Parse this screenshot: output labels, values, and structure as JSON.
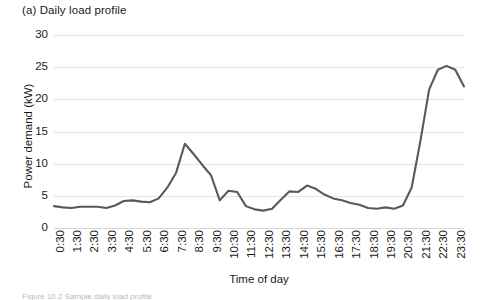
{
  "figure": {
    "panel_title": "(a) Daily load profile",
    "caption_partial": "Figure 10.2  Sample daily load profile",
    "line_color": "#595959",
    "grid_color": "#e3e3e3",
    "background_color": "#ffffff"
  },
  "chart_data": {
    "type": "line",
    "title": "(a) Daily load profile",
    "xlabel": "Time of day",
    "ylabel": "Power demand (kW)",
    "ylim": [
      0,
      30
    ],
    "yticks": [
      0,
      5,
      10,
      15,
      20,
      25,
      30
    ],
    "grid": true,
    "legend": null,
    "x": [
      "0:30",
      "1:00",
      "1:30",
      "2:00",
      "2:30",
      "3:00",
      "3:30",
      "4:00",
      "4:30",
      "5:00",
      "5:30",
      "6:00",
      "6:30",
      "7:00",
      "7:30",
      "8:00",
      "8:30",
      "9:00",
      "9:30",
      "10:00",
      "10:30",
      "11:00",
      "11:30",
      "12:00",
      "12:30",
      "13:00",
      "13:30",
      "14:00",
      "14:30",
      "15:00",
      "15:30",
      "16:00",
      "16:30",
      "17:00",
      "17:30",
      "18:00",
      "18:30",
      "19:00",
      "19:30",
      "20:00",
      "20:30",
      "21:00",
      "21:30",
      "22:00",
      "22:30",
      "23:00",
      "23:30",
      "24:00"
    ],
    "xticks": [
      "0:30",
      "1:30",
      "2:30",
      "3:30",
      "4:30",
      "5:30",
      "6:30",
      "7:30",
      "8:30",
      "9:30",
      "10:30",
      "11:30",
      "12:30",
      "13:30",
      "14:30",
      "15:30",
      "16:30",
      "17:30",
      "18:30",
      "19:30",
      "20:30",
      "21:30",
      "22:30",
      "23:30"
    ],
    "xtick_rotation": 90,
    "values": [
      3.4,
      3.2,
      3.1,
      3.3,
      3.3,
      3.3,
      3.1,
      3.5,
      4.2,
      4.3,
      4.1,
      8.0,
      10.5,
      13.1,
      11.6,
      9.6,
      7.6,
      4.3,
      5.8,
      4.3,
      3.6,
      3.4,
      2.7,
      2.8,
      3.8,
      5.6,
      5.9,
      5.6,
      6.6,
      6.0,
      5.1,
      4.6,
      4.2,
      3.6,
      3.2,
      3.0,
      3.1,
      3.4,
      3.0,
      3.1,
      4.6,
      8.0,
      14.5,
      20.5,
      24.0,
      25.2,
      24.9,
      23.8
    ],
    "series": [
      {
        "name": "Power demand",
        "color": "#595959",
        "points": [
          {
            "t": "0:30",
            "kw": 3.4
          },
          {
            "t": "1:00",
            "kw": 3.2
          },
          {
            "t": "1:30",
            "kw": 3.1
          },
          {
            "t": "2:00",
            "kw": 3.3
          },
          {
            "t": "2:30",
            "kw": 3.3
          },
          {
            "t": "3:00",
            "kw": 3.3
          },
          {
            "t": "3:30",
            "kw": 3.1
          },
          {
            "t": "4:00",
            "kw": 3.5
          },
          {
            "t": "4:30",
            "kw": 4.2
          },
          {
            "t": "5:00",
            "kw": 4.3
          },
          {
            "t": "5:30",
            "kw": 4.1
          },
          {
            "t": "6:00",
            "kw": 8.0
          },
          {
            "t": "6:30",
            "kw": 10.5
          },
          {
            "t": "7:00",
            "kw": 13.1
          },
          {
            "t": "7:30",
            "kw": 11.6
          },
          {
            "t": "8:00",
            "kw": 9.6
          },
          {
            "t": "8:30",
            "kw": 7.6
          },
          {
            "t": "9:00",
            "kw": 4.3
          },
          {
            "t": "9:30",
            "kw": 5.8
          },
          {
            "t": "10:00",
            "kw": 4.3
          },
          {
            "t": "10:30",
            "kw": 3.6
          },
          {
            "t": "11:00",
            "kw": 3.4
          },
          {
            "t": "11:30",
            "kw": 2.7
          },
          {
            "t": "12:00",
            "kw": 2.8
          },
          {
            "t": "12:30",
            "kw": 3.8
          },
          {
            "t": "13:00",
            "kw": 5.6
          },
          {
            "t": "13:30",
            "kw": 5.9
          },
          {
            "t": "14:00",
            "kw": 5.6
          },
          {
            "t": "14:30",
            "kw": 6.6
          },
          {
            "t": "15:00",
            "kw": 6.0
          },
          {
            "t": "15:30",
            "kw": 5.1
          },
          {
            "t": "16:00",
            "kw": 4.6
          },
          {
            "t": "16:30",
            "kw": 4.2
          },
          {
            "t": "17:00",
            "kw": 3.6
          },
          {
            "t": "17:30",
            "kw": 3.2
          },
          {
            "t": "18:00",
            "kw": 3.0
          },
          {
            "t": "18:30",
            "kw": 3.1
          },
          {
            "t": "19:00",
            "kw": 3.4
          },
          {
            "t": "19:30",
            "kw": 3.0
          },
          {
            "t": "20:00",
            "kw": 3.1
          },
          {
            "t": "20:30",
            "kw": 4.6
          },
          {
            "t": "21:00",
            "kw": 8.0
          },
          {
            "t": "21:30",
            "kw": 14.5
          },
          {
            "t": "22:00",
            "kw": 20.5
          },
          {
            "t": "22:30",
            "kw": 24.0
          },
          {
            "t": "23:00",
            "kw": 25.2
          },
          {
            "t": "23:30",
            "kw": 24.9
          },
          {
            "t": "24:00",
            "kw": 23.8
          }
        ]
      }
    ],
    "plot_points_kw": [
      3.4,
      3.2,
      3.1,
      3.3,
      3.3,
      3.3,
      3.1,
      3.5,
      4.2,
      4.3,
      4.1,
      4.0,
      4.6,
      6.3,
      8.6,
      13.1,
      11.5,
      9.8,
      8.2,
      4.3,
      5.8,
      5.6,
      3.4,
      2.9,
      2.7,
      3.0,
      4.4,
      5.7,
      5.6,
      6.6,
      6.1,
      5.2,
      4.6,
      4.3,
      3.9,
      3.6,
      3.1,
      3.0,
      3.2,
      3.0,
      3.5,
      6.3,
      13.5,
      21.5,
      24.6,
      25.2,
      24.6,
      22.0
    ]
  },
  "axes": {
    "y_tick_labels": [
      "30",
      "25",
      "20",
      "15",
      "10",
      "5",
      "0"
    ],
    "x_tick_labels": [
      "0:30",
      "1:30",
      "2:30",
      "3:30",
      "4:30",
      "5:30",
      "6:30",
      "7:30",
      "8:30",
      "9:30",
      "10:30",
      "11:30",
      "12:30",
      "13:30",
      "14:30",
      "15:30",
      "16:30",
      "17:30",
      "18:30",
      "19:30",
      "20:30",
      "21:30",
      "22:30",
      "23:30"
    ],
    "y_axis_title": "Power demand (kW)",
    "x_axis_title": "Time of day"
  }
}
